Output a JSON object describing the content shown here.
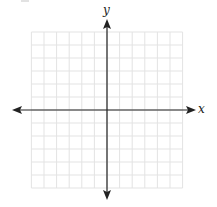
{
  "chart_data": {
    "type": "coordinate-plane",
    "title": "",
    "xlabel": "x",
    "ylabel": "y",
    "grid": true,
    "x_cells_left": 6,
    "x_cells_right": 6,
    "y_cells_up": 6,
    "y_cells_down": 6,
    "axis_arrows": [
      "left",
      "right",
      "up",
      "down"
    ],
    "tick_labels": [],
    "data_points": []
  },
  "labels": {
    "x_axis": "x",
    "y_axis": "y"
  },
  "colors": {
    "axis": "#222222",
    "grid": "#e3e3e3",
    "background": "#ffffff"
  }
}
